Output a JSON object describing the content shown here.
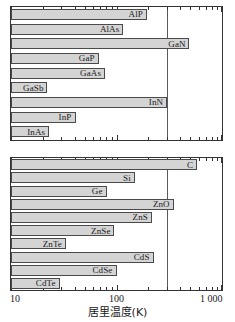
{
  "chart_data": {
    "type": "bar",
    "orientation": "horizontal",
    "title": "",
    "xlabel": "居里温度(K)",
    "ylabel": "",
    "xscale": "log",
    "xlim": [
      10,
      1000
    ],
    "grid": false,
    "legend": null,
    "annotations": [
      {
        "name": "room-temperature-line",
        "value": 300,
        "label": ""
      }
    ],
    "tick_labels": [
      "10",
      "100",
      "1 000"
    ],
    "tick_values": [
      10,
      100,
      1000
    ],
    "panels": [
      {
        "name": "iii-v-semiconductors",
        "categories": [
          "AlP",
          "AlAs",
          "GaN",
          "GaP",
          "GaAs",
          "GaSb",
          "InN",
          "InP",
          "InAs"
        ],
        "values": [
          193,
          115,
          490,
          68,
          78,
          22,
          300,
          41,
          23
        ]
      },
      {
        "name": "group-iv-and-ii-vi-semiconductors",
        "categories": [
          "C",
          "Si",
          "Ge",
          "ZnO",
          "ZnS",
          "ZnSe",
          "ZnTe",
          "CdS",
          "CdSe",
          "CdTe"
        ],
        "values": [
          580,
          150,
          81,
          350,
          215,
          95,
          33,
          225,
          100,
          29
        ]
      }
    ]
  },
  "axis": {
    "title": "居里温度(K)",
    "ticks": [
      {
        "label": "10",
        "value": 10
      },
      {
        "label": "100",
        "value": 100
      },
      {
        "label": "1 000",
        "value": 1000
      }
    ]
  },
  "panel_top": {
    "bars": [
      {
        "label": "AlP",
        "value": 193
      },
      {
        "label": "AlAs",
        "value": 115
      },
      {
        "label": "GaN",
        "value": 490
      },
      {
        "label": "GaP",
        "value": 68
      },
      {
        "label": "GaAs",
        "value": 78
      },
      {
        "label": "GaSb",
        "value": 22
      },
      {
        "label": "InN",
        "value": 300
      },
      {
        "label": "InP",
        "value": 41
      },
      {
        "label": "InAs",
        "value": 23
      }
    ]
  },
  "panel_bottom": {
    "bars": [
      {
        "label": "C",
        "value": 580
      },
      {
        "label": "Si",
        "value": 150
      },
      {
        "label": "Ge",
        "value": 81
      },
      {
        "label": "ZnO",
        "value": 350
      },
      {
        "label": "ZnS",
        "value": 215
      },
      {
        "label": "ZnSe",
        "value": 95
      },
      {
        "label": "ZnTe",
        "value": 33
      },
      {
        "label": "CdS",
        "value": 225
      },
      {
        "label": "CdSe",
        "value": 100
      },
      {
        "label": "CdTe",
        "value": 29
      }
    ]
  },
  "colors": {
    "bar_fill": "#d4d4d4",
    "bar_stroke": "#4a4a4a",
    "frame": "#333333",
    "refline": "#5a5a5a",
    "text": "#1a1a1a",
    "background": "#ffffff"
  }
}
